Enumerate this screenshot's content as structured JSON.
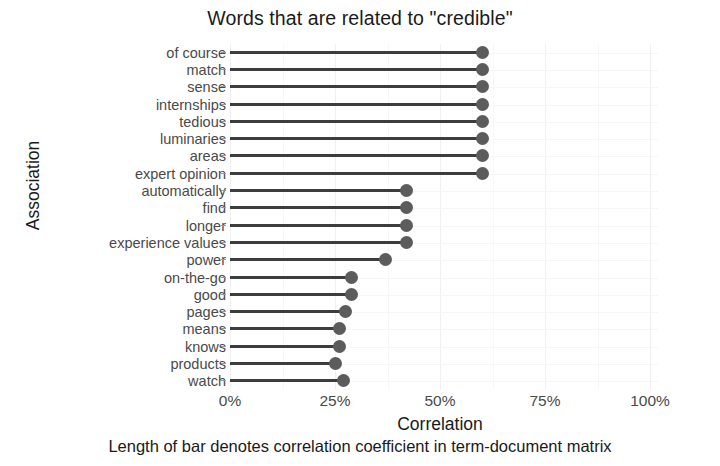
{
  "chart_data": {
    "type": "bar",
    "subtype": "lollipop-horizontal",
    "title": "Words that are related to \"credible\"",
    "xlabel": "Correlation",
    "ylabel": "Association",
    "caption": "Length of bar denotes correlation coefficient in term-document matrix",
    "xlim": [
      0,
      1.0
    ],
    "xticks": [
      0,
      25,
      50,
      75,
      100
    ],
    "xticklabels": [
      "0%",
      "25%",
      "50%",
      "75%",
      "100%"
    ],
    "grid": true,
    "legend": false,
    "orientation": "horizontal",
    "categories": [
      "of course",
      "match",
      "sense",
      "internships",
      "tedious",
      "luminaries",
      "areas",
      "expert opinion",
      "automatically",
      "find",
      "longer",
      "experience values",
      "power",
      "on-the-go",
      "good",
      "pages",
      "means",
      "knows",
      "products",
      "watch"
    ],
    "values": [
      60,
      60,
      60,
      60,
      60,
      60,
      60,
      60,
      42,
      42,
      42,
      42,
      37,
      29,
      29,
      27.5,
      26,
      26,
      25,
      27
    ],
    "points": [
      {
        "label": "of course",
        "value": 60
      },
      {
        "label": "match",
        "value": 60
      },
      {
        "label": "sense",
        "value": 60
      },
      {
        "label": "internships",
        "value": 60
      },
      {
        "label": "tedious",
        "value": 60
      },
      {
        "label": "luminaries",
        "value": 60
      },
      {
        "label": "areas",
        "value": 60
      },
      {
        "label": "expert opinion",
        "value": 60
      },
      {
        "label": "automatically",
        "value": 42
      },
      {
        "label": "find",
        "value": 42
      },
      {
        "label": "longer",
        "value": 42
      },
      {
        "label": "experience values",
        "value": 42
      },
      {
        "label": "power",
        "value": 37
      },
      {
        "label": "on-the-go",
        "value": 29
      },
      {
        "label": "good",
        "value": 29
      },
      {
        "label": "pages",
        "value": 27.5
      },
      {
        "label": "means",
        "value": 26
      },
      {
        "label": "knows",
        "value": 26
      },
      {
        "label": "products",
        "value": 25
      },
      {
        "label": "watch",
        "value": 27
      }
    ],
    "colors": {
      "stem": "#3d3d3d",
      "dot": "#5c5c5c",
      "grid": "#f0f0f2",
      "text": "#1a1a1a",
      "tick_text": "#4a4a4a",
      "background": "#ffffff"
    }
  }
}
